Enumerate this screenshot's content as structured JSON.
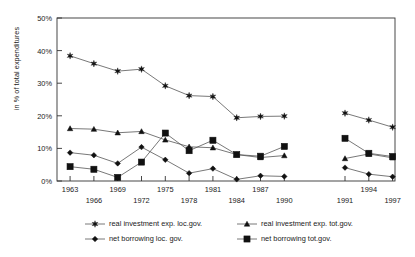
{
  "chart_data": {
    "type": "line",
    "title": "",
    "xlabel": "",
    "ylabel": "in % of total expenditures",
    "ylim": [
      0,
      50
    ],
    "yticks": [
      "0%",
      "10%",
      "20%",
      "30%",
      "40%",
      "50%"
    ],
    "ytick_values": [
      0,
      10,
      20,
      30,
      40,
      50
    ],
    "grid": false,
    "legend_position": "bottom",
    "axis_break_note": "series split into two panels: 1963-1990 and 1991-1997",
    "categories": [
      "1963",
      "1966",
      "1969",
      "1972",
      "1975",
      "1978",
      "1981",
      "1984",
      "1987",
      "1990",
      "1991",
      "1994",
      "1997"
    ],
    "xtick_labels_top": [
      "1963",
      "1969",
      "1975",
      "1981",
      "1987",
      "1994"
    ],
    "xtick_labels_bottom": [
      "1966",
      "1972",
      "1978",
      "1984",
      "1990",
      "1991",
      "1997"
    ],
    "series": [
      {
        "name": "real investment exp. loc.gov.",
        "marker": "star",
        "values": [
          38.4,
          36.0,
          33.7,
          34.3,
          29.2,
          26.2,
          25.9,
          19.4,
          19.8,
          19.9,
          20.8,
          18.7,
          16.5
        ]
      },
      {
        "name": "real investment exp. tot.gov.",
        "marker": "triangle",
        "values": [
          16.1,
          15.9,
          14.8,
          15.2,
          12.6,
          10.5,
          10.2,
          8.1,
          7.2,
          7.8,
          6.9,
          8.3,
          7.1
        ]
      },
      {
        "name": "net borrowing loc. gov.",
        "marker": "diamond",
        "values": [
          8.7,
          7.9,
          5.4,
          10.4,
          6.5,
          2.4,
          3.8,
          0.5,
          1.6,
          1.4,
          4.1,
          2.1,
          1.3
        ]
      },
      {
        "name": "net borrowing tot.gov.",
        "marker": "square",
        "values": [
          4.4,
          3.6,
          1.1,
          5.8,
          14.7,
          9.3,
          12.5,
          8.1,
          7.6,
          10.6,
          13.1,
          8.5,
          7.5
        ]
      }
    ]
  },
  "legend": {
    "items": [
      {
        "label": "real investment exp. loc.gov.",
        "marker": "star"
      },
      {
        "label": "real investment exp. tot.gov.",
        "marker": "triangle"
      },
      {
        "label": "net borrowing loc. gov.",
        "marker": "diamond"
      },
      {
        "label": "net borrowing tot.gov.",
        "marker": "square"
      }
    ]
  }
}
